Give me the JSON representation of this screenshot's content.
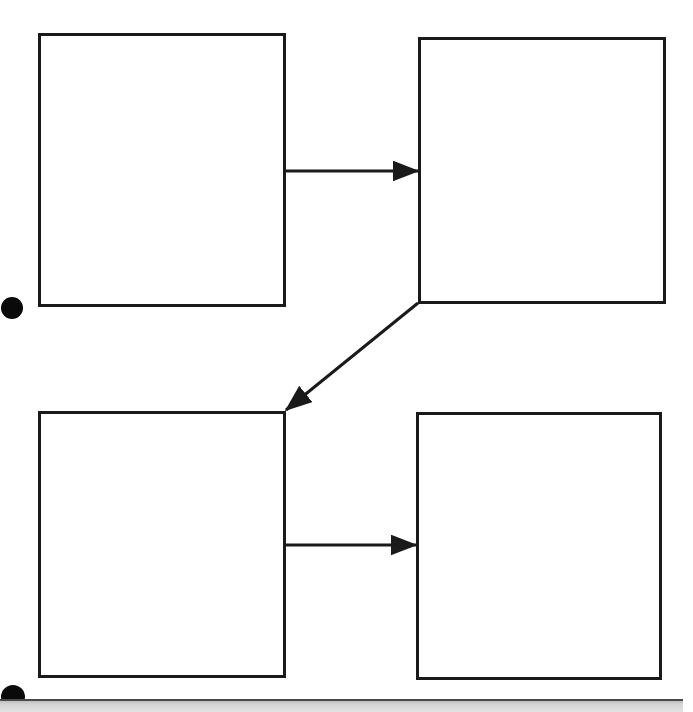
{
  "canvas": {
    "width": 693,
    "height": 712,
    "background_color": "#ffffff"
  },
  "diagram": {
    "title": "",
    "stroke_color": "#1a1a1a",
    "stroke_width": 3,
    "nodes": [
      {
        "id": "node-top-left",
        "label": "",
        "x": 38,
        "y": 33,
        "width": 248,
        "height": 274
      },
      {
        "id": "node-top-right",
        "label": "",
        "x": 418,
        "y": 37,
        "width": 248,
        "height": 267
      },
      {
        "id": "node-bottom-left",
        "label": "",
        "x": 38,
        "y": 411,
        "width": 248,
        "height": 267
      },
      {
        "id": "node-bottom-right",
        "label": "",
        "x": 416,
        "y": 412,
        "width": 246,
        "height": 268
      }
    ],
    "connectors": [
      {
        "id": "connector-top-horizontal",
        "label": "",
        "kind": "arrow",
        "from": "node-top-left",
        "to": "node-top-right",
        "x1": 285,
        "y1": 171,
        "x2": 418,
        "y2": 171
      },
      {
        "id": "connector-diagonal",
        "label": "",
        "kind": "arrow",
        "from": "node-top-right",
        "to": "node-bottom-left",
        "x1": 418,
        "y1": 303,
        "x2": 286,
        "y2": 410
      },
      {
        "id": "connector-bottom-horizontal",
        "label": "",
        "kind": "arrow",
        "from": "node-bottom-left",
        "to": "node-bottom-right",
        "x1": 285,
        "y1": 545,
        "x2": 416,
        "y2": 545
      }
    ],
    "markers": [
      {
        "id": "marker-dot-upper",
        "cx": 12,
        "cy": 308,
        "r": 11,
        "color": "#0a0a0a"
      },
      {
        "id": "marker-dot-lower",
        "cx": 13,
        "cy": 697,
        "r": 12,
        "color": "#0a0a0a"
      }
    ],
    "bottom_bar": {
      "label": "",
      "x": 0,
      "y": 699,
      "width": 683,
      "height": 13,
      "fill_color": "#d6d6d6",
      "border_color": "#4a4a4a"
    }
  }
}
